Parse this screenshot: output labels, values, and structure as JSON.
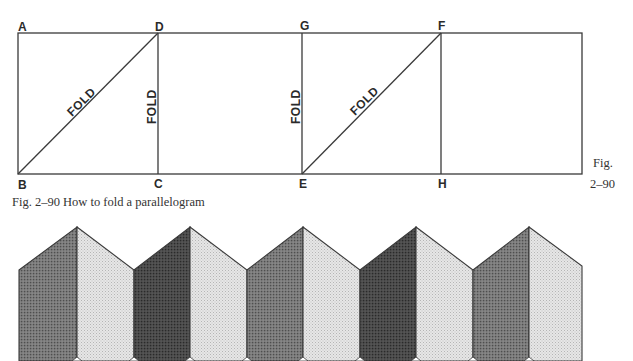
{
  "figure": {
    "caption": "Fig. 2–90 How to fold a parallelogram",
    "side_label_line1": "Fig.",
    "side_label_line2": "2–90"
  },
  "diagram": {
    "points": {
      "A": "A",
      "B": "B",
      "C": "C",
      "D": "D",
      "E": "E",
      "F": "F",
      "G": "G",
      "H": "H"
    },
    "fold_labels": [
      "FOLD",
      "FOLD",
      "FOLD",
      "FOLD"
    ]
  },
  "colors": {
    "line": "#3a3a3a",
    "dark_panel": "#5a5a5a",
    "darkest_panel": "#3c3c3c",
    "light_panel": "#dcdcdc",
    "background": "#ffffff"
  }
}
